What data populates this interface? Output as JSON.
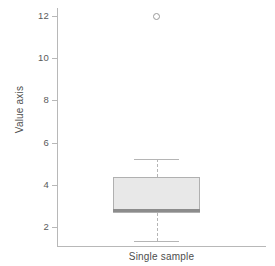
{
  "chart_data": {
    "type": "box",
    "title": "",
    "xlabel": "Single sample",
    "ylabel": "Value axis",
    "ylim": [
      1.0,
      12.4
    ],
    "yticks": [
      2,
      4,
      6,
      8,
      10,
      12
    ],
    "ytick_labels": [
      "2",
      "4",
      "6",
      "8",
      "10",
      "12"
    ],
    "grid": false,
    "legend": null,
    "categories": [
      "Single sample"
    ],
    "boxes": [
      {
        "label": "Single sample",
        "whisker_low": 1.35,
        "q1": 2.68,
        "median": 2.8,
        "q3": 4.37,
        "whisker_high": 5.22,
        "outliers": [
          11.98
        ],
        "box_fill": "#e8e8e8",
        "box_edge": "#b0b0b0",
        "median_color": "#8c8c8c",
        "whisker_color": "#b5b5b5",
        "outlier_color": "#9a9a9a"
      }
    ]
  },
  "axes": {
    "y_title": "Value axis",
    "x_title": "Single sample",
    "tick_labels": {
      "t12": "12",
      "t10": "10",
      "t8": "8",
      "t6": "6",
      "t4": "4",
      "t2": "2"
    }
  },
  "colors": {
    "axis": "#b8b8b8",
    "tick_text": "#5a5a5a",
    "title_text": "#4d4d4d",
    "box_fill": "#e8e8e8",
    "box_edge": "#b0b0b0",
    "median": "#8c8c8c",
    "whisker": "#b5b5b5",
    "outlier": "#9a9a9a",
    "background": "#ffffff"
  }
}
